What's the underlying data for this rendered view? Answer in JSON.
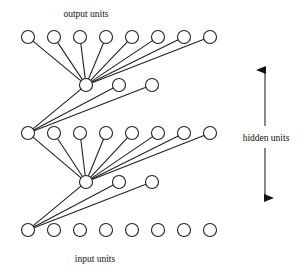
{
  "diagram": {
    "labels": {
      "output": "output units",
      "hidden": "hidden units",
      "input": "input units"
    },
    "layers": [
      {
        "name": "output",
        "units": 8
      },
      {
        "name": "hidden-2",
        "units": 3
      },
      {
        "name": "hidden-1",
        "units": 8
      },
      {
        "name": "hidden-0",
        "units": 3
      },
      {
        "name": "input",
        "units": 8
      }
    ],
    "connections": [
      {
        "from_layer": "hidden-2",
        "from_unit": 0,
        "to_layer": "output",
        "to_units": "all"
      },
      {
        "from_layer": "hidden-1",
        "from_unit": 0,
        "to_layer": "hidden-2",
        "to_units": "all"
      },
      {
        "from_layer": "hidden-0",
        "from_unit": 0,
        "to_layer": "hidden-1",
        "to_units": "all"
      },
      {
        "from_layer": "input",
        "from_unit": 0,
        "to_layer": "hidden-0",
        "to_units": "all"
      }
    ],
    "colors": {
      "stroke": "#222222",
      "background": "#ffffff"
    }
  }
}
